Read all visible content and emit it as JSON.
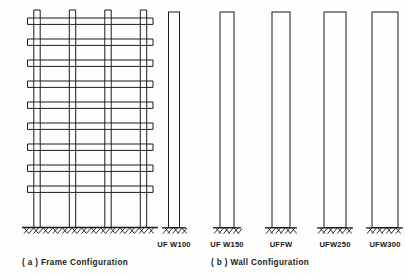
{
  "figure": {
    "background_color": "#fdfdfb",
    "ink_color": "#1b1b1b"
  },
  "panels": [
    {
      "id": "frame",
      "caption": "( a )  Frame  Configuration",
      "kind": "moment-frame",
      "bays": 3,
      "stories": 10,
      "member_style": "double-line hollow",
      "base_support": "fixed, hatched ground line"
    },
    {
      "id": "wall",
      "caption": "( b )   Wall  Configuration",
      "kind": "shear-walls",
      "count": 5,
      "base_support": "fixed, hatched ground line"
    }
  ],
  "captions": {
    "frame": "( a )  Frame  Configuration",
    "wall": "( b )   Wall  Configuration"
  },
  "walls": [
    {
      "label": "UF W100",
      "center_x": 174,
      "width": 11,
      "thickness_mm": 100
    },
    {
      "label": "UF W150",
      "center_x": 227,
      "width": 14,
      "thickness_mm": 150
    },
    {
      "label": "UFFW",
      "center_x": 281,
      "width": 18,
      "thickness_mm": 200
    },
    {
      "label": "UFW250",
      "center_x": 335,
      "width": 22,
      "thickness_mm": 250
    },
    {
      "label": "UFW300",
      "center_x": 385,
      "width": 26,
      "thickness_mm": 300
    }
  ]
}
